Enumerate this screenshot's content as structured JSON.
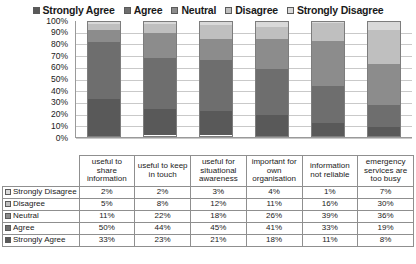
{
  "chart_data": {
    "type": "bar",
    "subtype": "100% stacked column",
    "title": "",
    "xlabel": "",
    "ylabel": "",
    "ylim": [
      0,
      100
    ],
    "yticks": [
      "0%",
      "10%",
      "20%",
      "30%",
      "40%",
      "50%",
      "60%",
      "70%",
      "80%",
      "90%",
      "100%"
    ],
    "grid": true,
    "legend_position": "top",
    "categories": [
      "useful to share information",
      "useful to keep in touch",
      "useful for situational awareness",
      "important for own organisation",
      "information not reliable",
      "emergency services are too busy"
    ],
    "series": [
      {
        "name": "Strongly Agree",
        "color": "#595959",
        "values": [
          33,
          23,
          21,
          18,
          11,
          8
        ]
      },
      {
        "name": "Agree",
        "color": "#6e6e6e",
        "values": [
          50,
          44,
          45,
          41,
          33,
          19
        ]
      },
      {
        "name": "Neutral",
        "color": "#8c8c8c",
        "values": [
          11,
          22,
          18,
          26,
          39,
          36
        ]
      },
      {
        "name": "Disagree",
        "color": "#bfbfbf",
        "values": [
          5,
          8,
          12,
          11,
          16,
          30
        ]
      },
      {
        "name": "Strongly Disagree",
        "color": "#d9d9d9",
        "values": [
          2,
          2,
          3,
          4,
          1,
          7
        ]
      }
    ]
  },
  "legend": {
    "items": [
      {
        "label": "Strongly Agree",
        "color": "#595959"
      },
      {
        "label": "Agree",
        "color": "#6e6e6e"
      },
      {
        "label": "Neutral",
        "color": "#8c8c8c"
      },
      {
        "label": "Disagree",
        "color": "#bfbfbf"
      },
      {
        "label": "Strongly Disagree",
        "color": "#d9d9d9"
      }
    ]
  },
  "table": {
    "columns": [
      "useful to share information",
      "useful to keep in touch",
      "useful for situational awareness",
      "important for own organisation",
      "information not reliable",
      "emergency services are too busy"
    ],
    "rows": [
      {
        "label": "Strongly Disagree",
        "color": "#d9d9d9",
        "values": [
          "2%",
          "2%",
          "3%",
          "4%",
          "1%",
          "7%"
        ]
      },
      {
        "label": "Disagree",
        "color": "#bfbfbf",
        "values": [
          "5%",
          "8%",
          "12%",
          "11%",
          "16%",
          "30%"
        ]
      },
      {
        "label": "Neutral",
        "color": "#8c8c8c",
        "values": [
          "11%",
          "22%",
          "18%",
          "26%",
          "39%",
          "36%"
        ]
      },
      {
        "label": "Agree",
        "color": "#6e6e6e",
        "values": [
          "50%",
          "44%",
          "45%",
          "41%",
          "33%",
          "19%"
        ]
      },
      {
        "label": "Strongly Agree",
        "color": "#595959",
        "values": [
          "33%",
          "23%",
          "21%",
          "18%",
          "11%",
          "8%"
        ]
      }
    ]
  }
}
